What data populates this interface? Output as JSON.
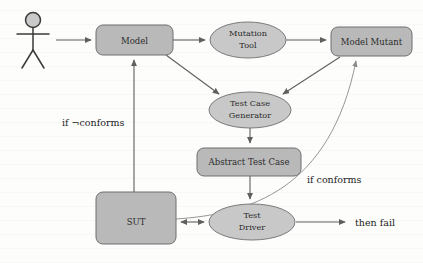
{
  "diagram": {
    "canvas": {
      "width": 423,
      "height": 263
    },
    "colors": {
      "node_fill": "#b9b9b9",
      "ellipse_fill": "#c8c8c8",
      "node_stroke": "#6e6e6e",
      "edge": "#5f5f5f",
      "edge_thin": "#8a8a8a",
      "text": "#2b2b2b",
      "background": "#fdfdfc"
    },
    "actor": {
      "name": "user-actor",
      "label": ""
    },
    "nodes": [
      {
        "id": "model",
        "label": "Model",
        "shape": "rounded-rect",
        "x": 96,
        "y": 25,
        "w": 77,
        "h": 30
      },
      {
        "id": "mutation_tool",
        "label": "Mutation\nTool",
        "line1": "Mutation",
        "line2": "Tool",
        "shape": "ellipse",
        "cx": 248,
        "cy": 40,
        "rx": 38,
        "ry": 18
      },
      {
        "id": "model_mutant",
        "label": "Model Mutant",
        "shape": "rounded-rect",
        "x": 331,
        "y": 27,
        "w": 81,
        "h": 29
      },
      {
        "id": "test_case_gen",
        "label": "Test Case\nGenerator",
        "line1": "Test Case",
        "line2": "Generator",
        "shape": "ellipse",
        "cx": 250,
        "cy": 110,
        "rx": 41,
        "ry": 18
      },
      {
        "id": "abstract_test",
        "label": "Abstract Test Case",
        "shape": "rounded-rect",
        "x": 197,
        "y": 148,
        "w": 104,
        "h": 28
      },
      {
        "id": "sut",
        "label": "SUT",
        "shape": "rounded-rect",
        "x": 96,
        "y": 192,
        "w": 80,
        "h": 52
      },
      {
        "id": "test_driver",
        "label": "Test\nDriver",
        "line1": "Test",
        "line2": "Driver",
        "shape": "ellipse",
        "cx": 252,
        "cy": 222,
        "rx": 43,
        "ry": 18
      }
    ],
    "edge_labels": [
      {
        "id": "if_not_conforms",
        "text": "if ¬conforms",
        "x": 62,
        "y": 126
      },
      {
        "id": "if_conforms",
        "text": "if conforms",
        "x": 307,
        "y": 183
      },
      {
        "id": "then_fail",
        "text": "then fail",
        "x": 355,
        "y": 226
      }
    ],
    "edges": [
      {
        "id": "actor-to-model",
        "from": "actor",
        "to": "model",
        "kind": "straight",
        "arrow": "single"
      },
      {
        "id": "model-to-mutation-tool",
        "from": "model",
        "to": "mutation_tool",
        "kind": "straight",
        "arrow": "single"
      },
      {
        "id": "mutation-tool-to-mutant",
        "from": "mutation_tool",
        "to": "model_mutant",
        "kind": "straight",
        "arrow": "single"
      },
      {
        "id": "model-to-test-case-gen",
        "from": "model",
        "to": "test_case_gen",
        "kind": "diagonal",
        "arrow": "single"
      },
      {
        "id": "mutant-to-test-case-gen",
        "from": "model_mutant",
        "to": "test_case_gen",
        "kind": "diagonal",
        "arrow": "single"
      },
      {
        "id": "test-case-gen-to-abstract",
        "from": "test_case_gen",
        "to": "abstract_test",
        "kind": "straight",
        "arrow": "single"
      },
      {
        "id": "abstract-to-test-driver",
        "from": "abstract_test",
        "to": "test_driver",
        "kind": "straight",
        "arrow": "single"
      },
      {
        "id": "sut-to-test-driver",
        "from": "sut",
        "to": "test_driver",
        "kind": "straight",
        "arrow": "double"
      },
      {
        "id": "sut-to-model",
        "from": "sut",
        "to": "model",
        "kind": "straight",
        "arrow": "single",
        "label": "if ¬conforms"
      },
      {
        "id": "sut-to-model-mutant",
        "from": "sut",
        "to": "model_mutant",
        "kind": "curve",
        "arrow": "single",
        "label": "if conforms"
      },
      {
        "id": "test-driver-to-fail",
        "from": "test_driver",
        "to": "then_fail",
        "kind": "straight",
        "arrow": "single",
        "label": "then fail"
      }
    ]
  }
}
